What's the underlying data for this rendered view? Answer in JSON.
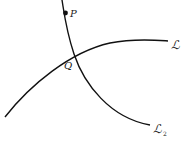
{
  "diagram": {
    "points": [
      {
        "name": "P",
        "label": "P"
      },
      {
        "name": "Q",
        "label": "Q"
      }
    ],
    "curves": [
      {
        "name": "curve-L",
        "label": "ℒ"
      },
      {
        "name": "curve-L2",
        "label": "ℒ",
        "subscript": "2"
      }
    ],
    "colors": {
      "stroke": "#111111",
      "background": "#ffffff"
    }
  }
}
